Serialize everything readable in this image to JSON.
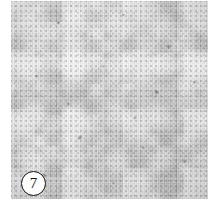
{
  "figure": {
    "panel_label": "7",
    "label_shape": "circle",
    "image_kind": "grayscale-micrograph",
    "subject_description": "mottled grey concrete / mortar surface texture",
    "colors": {
      "background": "#ffffff",
      "plate_mid_tone": "#c4c4c4",
      "plate_light_tone": "#d8d8d8",
      "plate_dark_tone": "#9a9a9a",
      "label_fill": "#fdfdfd",
      "label_stroke": "#121212",
      "label_text": "#111111"
    },
    "plate": {
      "left": 11,
      "top": 1,
      "width": 197,
      "height": 198
    },
    "label_position": {
      "left": 21,
      "top": 171,
      "diameter": 25
    }
  }
}
